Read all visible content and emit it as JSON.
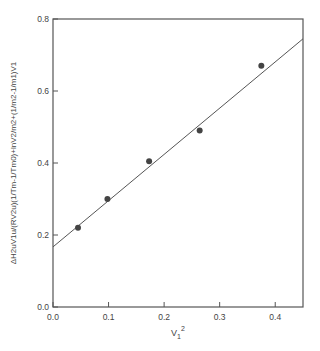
{
  "chart_data": {
    "type": "scatter",
    "title": "",
    "xlabel": "V1^2",
    "ylabel": "ΔH2uV1u/(RV2u)(1/Tm - 1/Tm0) + lnV2/m2 + (1/m2 - 1/m1)V1",
    "xlim": [
      0.0,
      0.45
    ],
    "ylim": [
      0.0,
      0.8
    ],
    "x_ticks": [
      "0.0",
      "0.1",
      "0.2",
      "0.3",
      "0.4"
    ],
    "y_ticks": [
      "0.0",
      "0.2",
      "0.4",
      "0.6",
      "0.8"
    ],
    "grid": false,
    "legend": null,
    "series": [
      {
        "name": "data",
        "x": [
          0.045,
          0.098,
          0.173,
          0.264,
          0.375
        ],
        "y": [
          0.22,
          0.3,
          0.405,
          0.49,
          0.67
        ]
      },
      {
        "name": "linear fit",
        "x": [
          0.0,
          0.45
        ],
        "y": [
          0.167,
          0.745
        ]
      }
    ]
  },
  "labels": {
    "x_axis": "V",
    "x_sub": "1",
    "x_sup": "2",
    "y_axis": "ΔH2uV1u/(RV2u)(1/Tm-1/Tm0)+lnV2/m2+(1/m2-1/m1)V1"
  }
}
